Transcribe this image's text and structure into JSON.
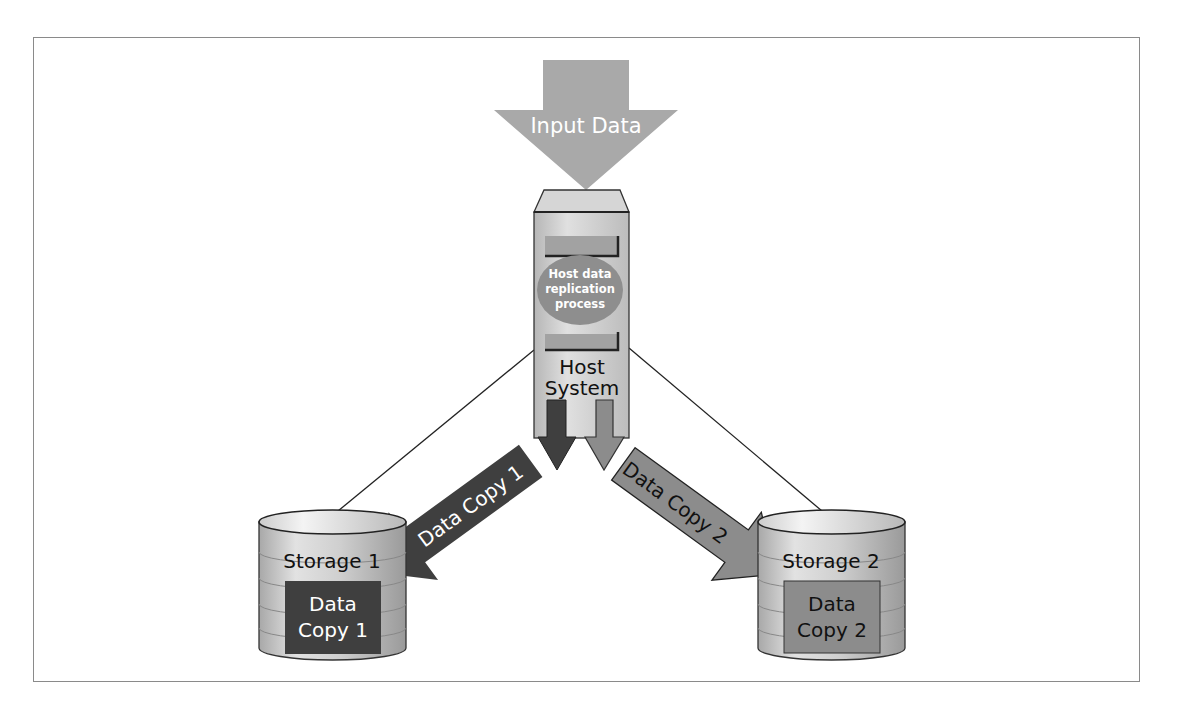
{
  "diagram": {
    "type": "host-based data replication",
    "input_arrow": {
      "label": "Input Data",
      "color": "#a9a9a9",
      "text_color": "#ffffff"
    },
    "host": {
      "label_line1": "Host",
      "label_line2": "System",
      "process_line1": "Host data",
      "process_line2": "replication",
      "process_line3": "process",
      "body_color": "#cfcfcf",
      "process_color": "#8e8e8e"
    },
    "copy_arrows": [
      {
        "label": "Data Copy 1",
        "color": "#3f3f3f",
        "text_color": "#ffffff"
      },
      {
        "label": "Data Copy 2",
        "color": "#8c8c8c",
        "text_color": "#1a1a1a"
      }
    ],
    "storage": [
      {
        "title": "Storage 1",
        "data_line1": "Data",
        "data_line2": "Copy 1",
        "box_color": "#3f3f3f",
        "box_text_color": "#ffffff"
      },
      {
        "title": "Storage 2",
        "data_line1": "Data",
        "data_line2": "Copy 2",
        "box_color": "#8c8c8c",
        "box_text_color": "#1a1a1a"
      }
    ]
  }
}
